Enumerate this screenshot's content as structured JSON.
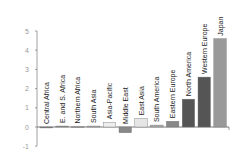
{
  "chart_data": {
    "type": "bar",
    "title": "",
    "xlabel": "",
    "ylabel": "",
    "ylim": [
      -1,
      5
    ],
    "yticks": [
      -1,
      0,
      1,
      2,
      3,
      4,
      5
    ],
    "grid": false,
    "categories": [
      "Central Africa",
      "E. and S. Africa",
      "Northern Africa",
      "South Asia",
      "Asia-Pacific",
      "Middle East",
      "East Asia",
      "South America",
      "Eastern Europe",
      "North America",
      "Western Europe",
      "Japan"
    ],
    "values": [
      -0.05,
      0.05,
      0.02,
      0.05,
      0.25,
      -0.3,
      0.45,
      0.1,
      0.3,
      1.45,
      2.6,
      4.6
    ],
    "colors": [
      "#777777",
      "#888888",
      "#999999",
      "#aaaaaa",
      "#eeeeee",
      "#888888",
      "#e6e6e6",
      "#aaaaaa",
      "#888888",
      "#555555",
      "#555555",
      "#999999"
    ]
  }
}
